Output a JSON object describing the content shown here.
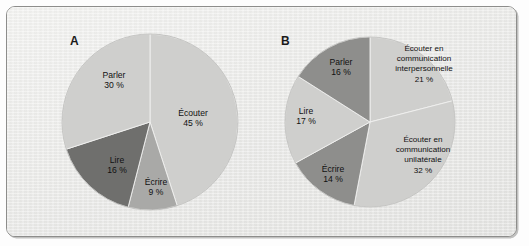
{
  "figure": {
    "background_color": "#eeeeec",
    "border_color": "#8d8d8b"
  },
  "panels": [
    {
      "id": "A",
      "letter": "A",
      "letter_pos": {
        "x": 70,
        "y": 45
      },
      "center": {
        "x": 150,
        "y": 122
      },
      "radius": 88
    },
    {
      "id": "B",
      "letter": "B",
      "letter_pos": {
        "x": 281,
        "y": 45
      },
      "center": {
        "x": 370,
        "y": 122
      },
      "radius": 85
    }
  ],
  "colors": {
    "light_gray": "#cfcfcd",
    "medium_gray": "#a9a9a7",
    "dark_gray": "#6f6f6d",
    "slice_edge": "#f1f1ef",
    "text": "#111111"
  },
  "chart_data": [
    {
      "type": "pie",
      "title": "A",
      "start_angle_deg": 0,
      "direction": "clockwise",
      "total": 100,
      "categories": [
        "Écouter",
        "Écrire",
        "Lire",
        "Parler"
      ],
      "values": [
        45,
        9,
        16,
        30
      ],
      "labels": [
        "Écouter\n45 %",
        "Écrire\n9 %",
        "Lire\n16 %",
        "Parler\n30 %"
      ],
      "slices": [
        {
          "name": "Écouter",
          "value": 45,
          "value_label": "45 %",
          "color": "#cfcfcd",
          "label_pos": {
            "x": 193,
            "y": 116
          },
          "lines": [
            "Écouter",
            "45 %"
          ]
        },
        {
          "name": "Écrire",
          "value": 9,
          "value_label": "9 %",
          "color": "#a9a9a7",
          "label_pos": {
            "x": 156,
            "y": 185
          },
          "lines": [
            "Écrire",
            "9 %"
          ]
        },
        {
          "name": "Lire",
          "value": 16,
          "value_label": "16 %",
          "color": "#6f6f6d",
          "label_pos": {
            "x": 117,
            "y": 163
          },
          "lines": [
            "Lire",
            "16 %"
          ]
        },
        {
          "name": "Parler",
          "value": 30,
          "value_label": "30 %",
          "color": "#cfcfcd",
          "label_pos": {
            "x": 114,
            "y": 78
          },
          "lines": [
            "Parler",
            "30 %"
          ]
        }
      ]
    },
    {
      "type": "pie",
      "title": "B",
      "start_angle_deg": 0,
      "direction": "clockwise",
      "total": 100,
      "categories": [
        "Écouter en communication interpersonnelle",
        "Écouter en communication unilatérale",
        "Écrire",
        "Lire",
        "Parler"
      ],
      "values": [
        21,
        32,
        14,
        17,
        16
      ],
      "slices": [
        {
          "name": "Écouter en communication interpersonnelle",
          "value": 21,
          "value_label": "21 %",
          "color": "#cfcfcd",
          "label_pos": {
            "x": 424,
            "y": 51
          },
          "lines": [
            "Écouter en",
            "communication",
            "interpersonnelle",
            "21 %"
          ]
        },
        {
          "name": "Écouter en communication unilatérale",
          "value": 32,
          "value_label": "32 %",
          "color": "#cfcfcd",
          "label_pos": {
            "x": 423,
            "y": 142
          },
          "lines": [
            "Écouter en",
            "communication",
            "unilatérale",
            "32 %"
          ]
        },
        {
          "name": "Écrire",
          "value": 14,
          "value_label": "14 %",
          "color": "#8e8e8c",
          "label_pos": {
            "x": 333,
            "y": 172
          },
          "lines": [
            "Écrire",
            "14 %"
          ]
        },
        {
          "name": "Lire",
          "value": 17,
          "value_label": "17 %",
          "color": "#cfcfcd",
          "label_pos": {
            "x": 306,
            "y": 114
          },
          "lines": [
            "Lire",
            "17 %"
          ]
        },
        {
          "name": "Parler",
          "value": 16,
          "value_label": "16 %",
          "color": "#8e8e8c",
          "label_pos": {
            "x": 341,
            "y": 65
          },
          "lines": [
            "Parler",
            "16 %"
          ]
        }
      ]
    }
  ]
}
